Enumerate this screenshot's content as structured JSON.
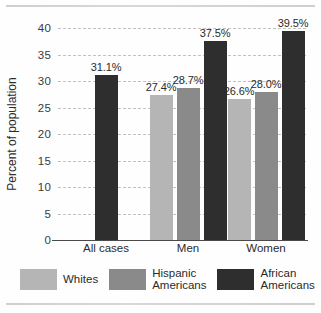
{
  "chart_data": {
    "type": "bar",
    "title": "",
    "xlabel": "",
    "ylabel": "Percent of population",
    "ylim": [
      0,
      40
    ],
    "yticks": [
      0,
      5,
      10,
      15,
      20,
      25,
      30,
      35,
      40
    ],
    "ytick_labels": [
      "0",
      "5",
      "10",
      "15",
      "20",
      "25",
      "30",
      "35",
      "40"
    ],
    "grid": true,
    "legend_position": "bottom",
    "categories": [
      "All cases",
      "Men",
      "Women"
    ],
    "series": [
      {
        "name": "Whites",
        "color": "#b5b5b5",
        "values": [
          null,
          27.4,
          26.6
        ],
        "labels": [
          "",
          "27.4%",
          "26.6%"
        ]
      },
      {
        "name": "Hispanic Americans",
        "color": "#8a8a8a",
        "values": [
          null,
          28.7,
          28.0
        ],
        "labels": [
          "",
          "28.7%",
          "28.0%"
        ]
      },
      {
        "name": "African Americans",
        "color": "#2e2e2e",
        "values": [
          31.1,
          37.5,
          39.5
        ],
        "labels": [
          "31.1%",
          "37.5%",
          "39.5%"
        ]
      }
    ]
  },
  "legend": {
    "items": [
      {
        "label": "Whites",
        "color": "#b5b5b5"
      },
      {
        "label": "Hispanic\nAmericans",
        "color": "#8a8a8a"
      },
      {
        "label": "African\nAmericans",
        "color": "#2e2e2e"
      }
    ]
  }
}
